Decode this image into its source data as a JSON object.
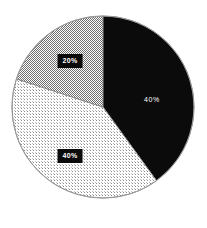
{
  "chart_data": {
    "type": "pie",
    "title": "",
    "subtitle": "",
    "xlabel": "",
    "ylabel": "",
    "grid": false,
    "legend": "none",
    "background_color": "#ffffff",
    "outline_color": "#999999",
    "start_angle_deg": 0,
    "direction": "clockwise",
    "center": {
      "x": 103,
      "y": 107
    },
    "radius": 91,
    "categories": [
      "Slice 1",
      "Slice 2",
      "Slice 3"
    ],
    "values": [
      40,
      40,
      20
    ],
    "value_unit": "%",
    "slices": [
      {
        "name": "slice-black",
        "label": "40%",
        "value": 40,
        "start_angle_deg": 0,
        "end_angle_deg": 144,
        "fill_style": "solid",
        "fill_color": "#0b0b0b",
        "label_color": "#ffffff",
        "label_box": false,
        "label_x": 152,
        "label_y": 99
      },
      {
        "name": "slice-light-dotted",
        "label": "40%",
        "value": 40,
        "start_angle_deg": 144,
        "end_angle_deg": 288,
        "fill_style": "sparse-dot-dither",
        "fill_color": "#d8d8d8",
        "label_color": "#ffffff",
        "label_box": true,
        "label_box_color": "#0b0b0b",
        "label_x": 70,
        "label_y": 156
      },
      {
        "name": "slice-checkerboard",
        "label": "20%",
        "value": 20,
        "start_angle_deg": 288,
        "end_angle_deg": 360,
        "fill_style": "checkerboard-dither",
        "fill_color": "#b0b0b0",
        "label_color": "#ffffff",
        "label_box": true,
        "label_box_color": "#0b0b0b",
        "label_x": 70,
        "label_y": 61
      }
    ]
  }
}
